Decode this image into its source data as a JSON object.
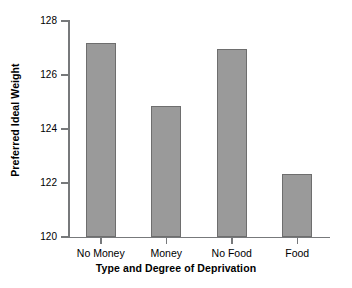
{
  "chart_data": {
    "type": "bar",
    "title": "",
    "subtitle": "",
    "xlabel": "Type and Degree of Deprivation",
    "ylabel": "Preferred Ideal Weight",
    "categories": [
      "No Money",
      "Money",
      "No Food",
      "Food"
    ],
    "values": [
      127.2,
      124.85,
      126.95,
      122.35
    ],
    "series": [
      {
        "name": "Preferred Ideal Weight",
        "values": [
          127.2,
          124.85,
          126.95,
          122.35
        ]
      }
    ],
    "ylim": [
      120,
      128
    ],
    "xlim": [
      0,
      4
    ],
    "y_ticks": [
      120,
      122,
      124,
      126,
      128
    ],
    "y_tick_labels": [
      "120",
      "122",
      "124",
      "126",
      "128"
    ],
    "x_tick_labels": [
      "No Money",
      "Money",
      "No Food",
      "Food"
    ],
    "grid": false,
    "legend": false,
    "legend_position": "none",
    "annotations": [],
    "colors": {
      "bar_fill": "#9a9a9a",
      "bar_edge": "#6e6e6e",
      "axis": "#77797b",
      "text": "#000000",
      "background": "#ffffff"
    }
  }
}
